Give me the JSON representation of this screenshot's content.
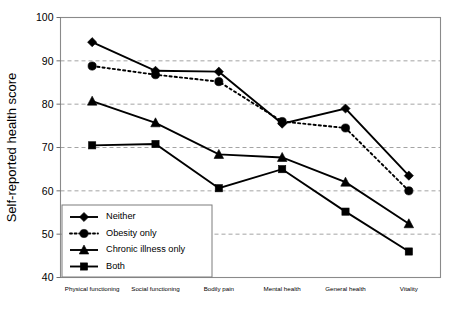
{
  "chart_data": {
    "type": "line",
    "title": "",
    "xlabel": "",
    "ylabel": "Self-reported health score",
    "ylim": [
      40,
      100
    ],
    "yticks": [
      40,
      50,
      60,
      70,
      80,
      90,
      100
    ],
    "ytick_labels": [
      "40",
      "50",
      "60",
      "70",
      "80",
      "90",
      "100"
    ],
    "grid": "horizontal dashed at 50, 60, 70, 80, 90",
    "legend_position": "lower left inside axes",
    "categories": [
      "Physical functioning",
      "Social functioning",
      "Bodily pain",
      "Mental health",
      "General health",
      "Vitality"
    ],
    "series": [
      {
        "name": "Neither",
        "marker": "diamond",
        "linestyle": "solid",
        "color": "#000000",
        "values": [
          94.3,
          87.7,
          87.5,
          75.5,
          79.0,
          63.5
        ]
      },
      {
        "name": "Obesity only",
        "marker": "circle",
        "linestyle": "dotted",
        "color": "#000000",
        "values": [
          88.8,
          86.8,
          85.2,
          76.0,
          74.5,
          60.0
        ]
      },
      {
        "name": "Chronic illness only",
        "marker": "triangle",
        "linestyle": "solid",
        "color": "#000000",
        "values": [
          80.7,
          75.7,
          68.4,
          67.7,
          62.0,
          52.4
        ]
      },
      {
        "name": "Both",
        "marker": "square",
        "linestyle": "solid",
        "color": "#000000",
        "values": [
          70.5,
          70.8,
          60.6,
          65.0,
          55.2,
          46.0
        ]
      }
    ]
  },
  "legend": {
    "items": [
      {
        "label": "Neither",
        "marker": "diamond",
        "linestyle": "solid"
      },
      {
        "label": "Obesity only",
        "marker": "circle",
        "linestyle": "dotted"
      },
      {
        "label": "Chronic illness only",
        "marker": "triangle",
        "linestyle": "solid"
      },
      {
        "label": "Both",
        "marker": "square",
        "linestyle": "solid"
      }
    ]
  },
  "axes": {
    "y_title": "Self-reported health score"
  }
}
